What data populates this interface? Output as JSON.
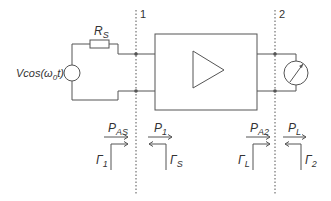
{
  "diagram": {
    "type": "two-port amplifier circuit",
    "source_label": "Vcos(ω0t)",
    "source_label_parts": {
      "main": "Vcos(ω",
      "sub": "0",
      "tail": "t)"
    },
    "resistor_label": {
      "main": "R",
      "sub": "S"
    },
    "reference_planes": [
      {
        "label": "1"
      },
      {
        "label": "2"
      }
    ],
    "components": [
      "voltage-source",
      "source-resistor",
      "amplifier-block",
      "load-meter"
    ],
    "power_labels": [
      {
        "main": "P",
        "sub": "AS"
      },
      {
        "main": "P",
        "sub": "1"
      },
      {
        "main": "P",
        "sub": "A2"
      },
      {
        "main": "P",
        "sub": "L"
      }
    ],
    "reflection_labels": [
      {
        "main": "Γ",
        "sub": "1"
      },
      {
        "main": "Γ",
        "sub": "S"
      },
      {
        "main": "Γ",
        "sub": "L"
      },
      {
        "main": "Γ",
        "sub": "2"
      }
    ],
    "colors": {
      "line": "#555555",
      "text": "#333333",
      "background": "#ffffff"
    }
  }
}
